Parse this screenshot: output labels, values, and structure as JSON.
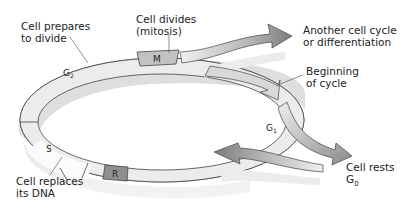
{
  "diagram": {
    "type": "cell-cycle",
    "colors": {
      "ring_fill": "#ebebeb",
      "ring_shadow": "#d9d9d9",
      "ring_stroke": "#444444",
      "mitosis_fill": "#c2c2c2",
      "restriction_fill": "#8f8f8f",
      "arrow_dark": "#8c8c8c",
      "arrow_light": "#e3e3e3",
      "text": "#222222"
    },
    "phases": {
      "g2": "G",
      "g2_sub": "2",
      "m": "M",
      "g1": "G",
      "g1_sub": "1",
      "s": "S",
      "r": "R"
    },
    "labels": {
      "prepares_line1": "Cell prepares",
      "prepares_line2": "to divide",
      "divides_line1": "Cell divides",
      "divides_line2": "(mitosis)",
      "another_line1": "Another cell cycle",
      "another_line2": "or differentiation",
      "beginning_line1": "Beginning",
      "beginning_line2": "of cycle",
      "rests_line1": "Cell rests",
      "rests_line2": "G",
      "rests_sub": "0",
      "replaces_line1": "Cell replaces",
      "replaces_line2": "its DNA"
    }
  }
}
